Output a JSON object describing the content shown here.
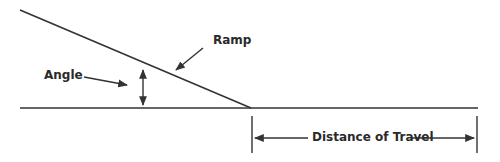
{
  "diagram": {
    "type": "ramp-geometry",
    "labels": {
      "ramp": "Ramp",
      "angle": "Angle",
      "distance": "Distance of Travel"
    },
    "colors": {
      "line": "#333333",
      "background": "#ffffff"
    }
  }
}
